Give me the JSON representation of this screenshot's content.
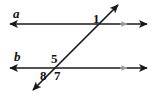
{
  "figure": {
    "background_color": "#ffffff",
    "stroke_color": "#1a1a1a",
    "marker_color": "#9a9a9a",
    "width": 157,
    "height": 96
  },
  "lines": [
    {
      "id": "line-a",
      "name": "a",
      "kind": "parallel-line",
      "orientation": "horizontal",
      "x1": 10,
      "y1": 24,
      "x2": 147,
      "y2": 24,
      "arrow_start": true,
      "arrow_end": true,
      "parallel_tick": {
        "x": 126,
        "y": 24,
        "color": "#9a9a9a"
      }
    },
    {
      "id": "line-b",
      "name": "b",
      "kind": "parallel-line",
      "orientation": "horizontal",
      "x1": 10,
      "y1": 68,
      "x2": 147,
      "y2": 68,
      "arrow_start": true,
      "arrow_end": true,
      "parallel_tick": {
        "x": 126,
        "y": 68,
        "color": "#9a9a9a"
      }
    },
    {
      "id": "transversal",
      "name": "",
      "kind": "transversal",
      "orientation": "diagonal",
      "x1": 33,
      "y1": 90,
      "x2": 118,
      "y2": 5,
      "arrow_start": true,
      "arrow_end": true,
      "parallel_tick": null
    }
  ],
  "intersections": [
    {
      "id": "intersection-top",
      "on_line": "a",
      "x": 99,
      "y": 24
    },
    {
      "id": "intersection-bottom",
      "on_line": "b",
      "x": 55,
      "y": 68
    }
  ],
  "labels": {
    "line_a": "a",
    "line_b": "b",
    "angle_1": "1",
    "angle_5": "5",
    "angle_8": "8",
    "angle_7": "7"
  }
}
